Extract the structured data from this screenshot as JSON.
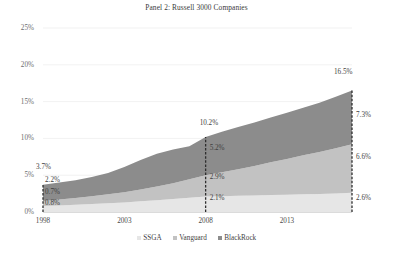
{
  "chart_data": {
    "type": "area",
    "title": "Panel 2: Russell 3000 Companies",
    "xlabel": "",
    "ylabel": "",
    "stacked": true,
    "grid": true,
    "legend_position": "bottom",
    "xlim": [
      1998,
      2017
    ],
    "ylim": [
      0,
      25
    ],
    "ytick_labels": [
      "25%",
      "20%",
      "15%",
      "10%",
      "5%",
      "0%"
    ],
    "ytick_values": [
      25,
      20,
      15,
      10,
      5,
      0
    ],
    "xtick_labels": [
      "1998",
      "2003",
      "2008",
      "2013"
    ],
    "xtick_values": [
      1998,
      2003,
      2008,
      2013
    ],
    "x": [
      1998,
      1999,
      2000,
      2001,
      2002,
      2003,
      2004,
      2005,
      2006,
      2007,
      2008,
      2009,
      2010,
      2011,
      2012,
      2013,
      2014,
      2015,
      2016,
      2017
    ],
    "series": [
      {
        "name": "SSGA",
        "color": "#e6e6e6",
        "values": [
          0.8,
          0.9,
          1.0,
          1.1,
          1.2,
          1.3,
          1.45,
          1.6,
          1.75,
          1.95,
          2.1,
          2.15,
          2.2,
          2.25,
          2.3,
          2.35,
          2.4,
          2.45,
          2.5,
          2.6
        ]
      },
      {
        "name": "Vanguard",
        "color": "#c2c2c2",
        "values": [
          0.7,
          0.8,
          0.9,
          1.05,
          1.2,
          1.4,
          1.6,
          1.85,
          2.15,
          2.5,
          2.9,
          3.25,
          3.6,
          4.0,
          4.45,
          4.85,
          5.3,
          5.7,
          6.15,
          6.6
        ]
      },
      {
        "name": "BlackRock",
        "color": "#8c8c8c",
        "values": [
          2.2,
          2.3,
          2.4,
          2.6,
          2.9,
          3.4,
          4.0,
          4.45,
          4.6,
          4.5,
          5.2,
          5.5,
          5.75,
          5.9,
          6.1,
          6.3,
          6.45,
          6.7,
          7.0,
          7.3
        ]
      }
    ],
    "annotations": {
      "start_year": {
        "total": "3.7%",
        "blackrock": "2.2%",
        "vanguard": "0.7%",
        "ssga": "0.8%"
      },
      "mid_year": {
        "total": "10.2%",
        "blackrock": "5.2%",
        "vanguard": "2.9%",
        "ssga": "2.1%"
      },
      "end_year": {
        "total": "16.5%",
        "blackrock": "7.3%",
        "vanguard": "6.6%",
        "ssga": "2.6%"
      }
    },
    "legend": [
      {
        "label": "SSGA",
        "color": "#e6e6e6"
      },
      {
        "label": "Vanguard",
        "color": "#c2c2c2"
      },
      {
        "label": "BlackRock",
        "color": "#8c8c8c"
      }
    ]
  }
}
